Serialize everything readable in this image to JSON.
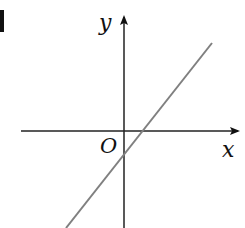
{
  "figure": {
    "type": "coordinate-plane",
    "axes": {
      "x_label": "x",
      "y_label": "y",
      "origin_label": "O"
    },
    "line": {
      "description": "straight line with positive slope, positive x-intercept, negative y-intercept",
      "color": "#808080"
    },
    "axis_color": "#111111"
  }
}
